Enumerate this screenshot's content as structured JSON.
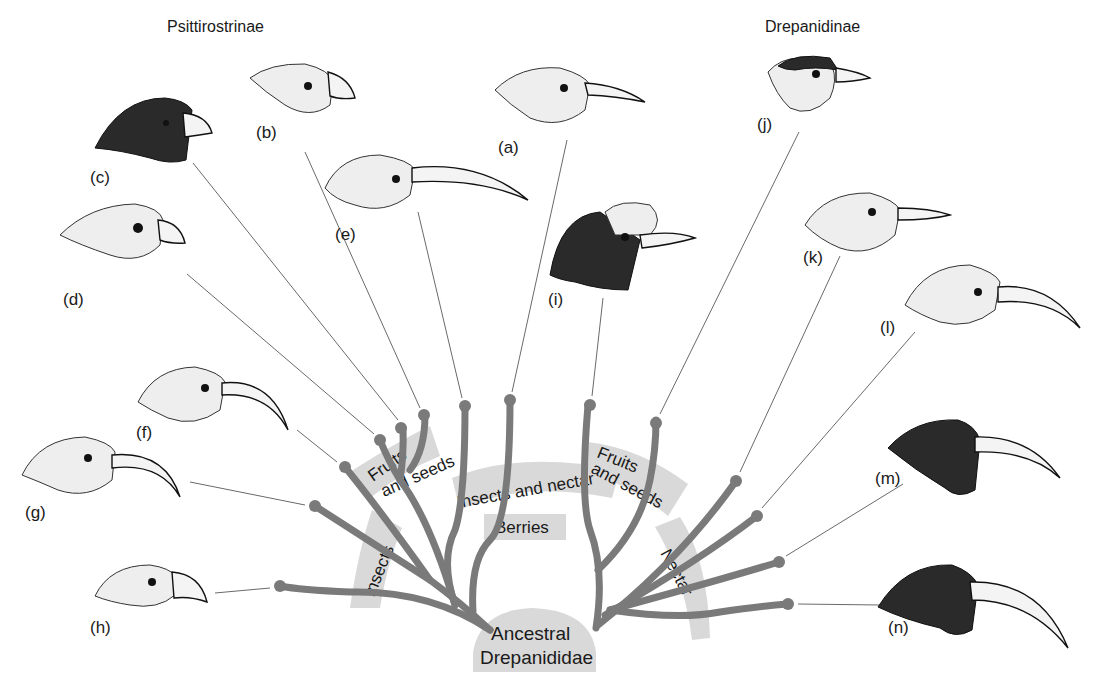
{
  "figure": {
    "subfamilies": {
      "left": "Psittirostrinae",
      "right": "Drepanidinae"
    },
    "ancestor": {
      "line1": "Ancestral",
      "line2": "Drepanididae"
    },
    "diet_bands": {
      "insects": "Insects",
      "fruits_left_line1": "Fruits",
      "fruits_left_line2": "and seeds",
      "insects_nectar": "Insects and nectar",
      "berries": "Berries",
      "fruits_right_line1": "Fruits",
      "fruits_right_line2": "and seeds",
      "nectar": "Nectar"
    },
    "specimens": {
      "a": "(a)",
      "b": "(b)",
      "c": "(c)",
      "d": "(d)",
      "e": "(e)",
      "f": "(f)",
      "g": "(g)",
      "h": "(h)",
      "i": "(i)",
      "j": "(j)",
      "k": "(k)",
      "l": "(l)",
      "m": "(m)",
      "n": "(n)"
    },
    "colors": {
      "branch": "#7a7a7a",
      "band": "#d9d9d9",
      "background": "#ffffff"
    }
  }
}
